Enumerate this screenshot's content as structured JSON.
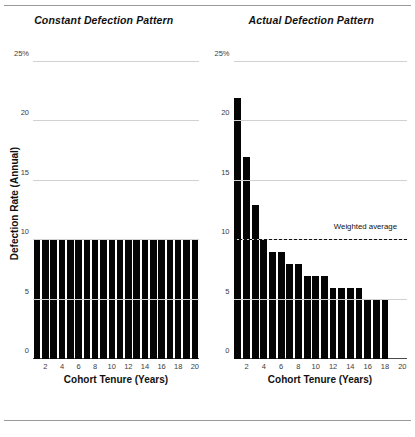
{
  "chart_data": [
    {
      "type": "bar",
      "title": "Constant Defection Pattern",
      "xlabel": "Cohort Tenure (Years)",
      "ylabel": "Defection Rate (Annual)",
      "categories": [
        1,
        2,
        3,
        4,
        5,
        6,
        7,
        8,
        9,
        10,
        11,
        12,
        13,
        14,
        15,
        16,
        17,
        18,
        19,
        20
      ],
      "values": [
        10,
        10,
        10,
        10,
        10,
        10,
        10,
        10,
        10,
        10,
        10,
        10,
        10,
        10,
        10,
        10,
        10,
        10,
        10,
        10
      ],
      "ylim": [
        0,
        25
      ],
      "yticks": [
        0,
        5,
        10,
        15,
        20,
        25
      ],
      "ytick_labels": [
        "0",
        "5",
        "10",
        "15",
        "20",
        "25%"
      ],
      "xtick_labels": [
        "",
        "2",
        "",
        "4",
        "",
        "6",
        "",
        "8",
        "",
        "10",
        "",
        "12",
        "",
        "14",
        "",
        "16",
        "",
        "18",
        "",
        "20"
      ],
      "grid": true,
      "legend": "none",
      "bar_color": "#050505"
    },
    {
      "type": "bar",
      "title": "Actual Defection Pattern",
      "xlabel": "Cohort Tenure (Years)",
      "ylabel": "Defection Rate (Annual)",
      "categories": [
        1,
        2,
        3,
        4,
        5,
        6,
        7,
        8,
        9,
        10,
        11,
        12,
        13,
        14,
        15,
        16,
        17,
        18,
        19,
        20
      ],
      "values": [
        22,
        17,
        13,
        10,
        9,
        9,
        8,
        8,
        7,
        7,
        7,
        6,
        6,
        6,
        6,
        5,
        5,
        5
      ],
      "ylim": [
        0,
        25
      ],
      "yticks": [
        0,
        5,
        10,
        15,
        20,
        25
      ],
      "ytick_labels": [
        "0",
        "5",
        "10",
        "15",
        "20",
        "25%"
      ],
      "xtick_labels": [
        "",
        "2",
        "",
        "4",
        "",
        "6",
        "",
        "8",
        "",
        "10",
        "",
        "12",
        "",
        "14",
        "",
        "16",
        "",
        "18",
        "",
        "20"
      ],
      "grid": true,
      "legend": "none",
      "bar_color": "#050505",
      "annotations": [
        {
          "type": "hline",
          "value": 10,
          "label": "Weighted average",
          "style": "dashed",
          "color": "#111111"
        }
      ]
    }
  ],
  "left_panel": {
    "title": "Constant Defection Pattern",
    "y_axis_title": "Defection Rate (Annual)",
    "x_axis_title": "Cohort Tenure (Years)"
  },
  "right_panel": {
    "title": "Actual Defection Pattern",
    "x_axis_title": "Cohort Tenure (Years)",
    "average_label": "Weighted average"
  }
}
